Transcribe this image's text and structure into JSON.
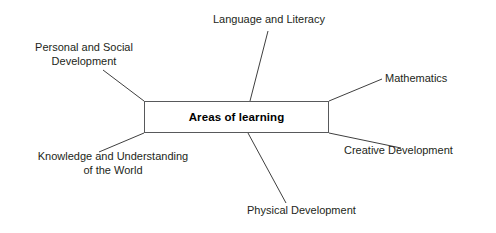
{
  "diagram": {
    "title": "Areas of learning",
    "center": {
      "label": "Areas of learning",
      "shape": "rectangle",
      "border_color": "#58595b",
      "fill_color": "#ffffff"
    },
    "line_color": "#3f3f3f",
    "background_color": "#ffffff",
    "text_color": "#231f20",
    "nodes": [
      {
        "id": "language-and-literacy",
        "label": "Language and Literacy",
        "lines": [
          "Language and Literacy"
        ],
        "position": "top"
      },
      {
        "id": "personal-and-social-development",
        "label": "Personal and Social Development",
        "lines": [
          "Personal and Social",
          "Development"
        ],
        "position": "top-left"
      },
      {
        "id": "mathematics",
        "label": "Mathematics",
        "lines": [
          "Mathematics"
        ],
        "position": "right-top"
      },
      {
        "id": "creative-development",
        "label": "Creative Development",
        "lines": [
          "Creative Development"
        ],
        "position": "right-bottom"
      },
      {
        "id": "knowledge-and-understanding-of-the-world",
        "label": "Knowledge and Understanding of the World",
        "lines": [
          "Knowledge and Understanding",
          "of the World"
        ],
        "position": "bottom-left"
      },
      {
        "id": "physical-development",
        "label": "Physical Development",
        "lines": [
          "Physical Development"
        ],
        "position": "bottom"
      }
    ]
  }
}
